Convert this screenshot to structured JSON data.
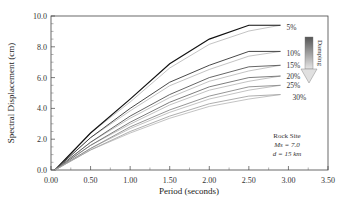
{
  "chart_data": {
    "type": "line",
    "title": "",
    "xlabel": "Period (seconds)",
    "ylabel": "Spectral Displacement (cm)",
    "xlim": [
      0.0,
      3.5
    ],
    "ylim": [
      0.0,
      10.0
    ],
    "xticks": [
      "0.00",
      "0.50",
      "1.00",
      "1.50",
      "2.00",
      "2.50",
      "3.00",
      "3.50"
    ],
    "yticks": [
      "0.0",
      "2.0",
      "4.0",
      "6.0",
      "8.0",
      "10.0"
    ],
    "grid": false,
    "x": [
      0.05,
      0.5,
      1.0,
      1.5,
      2.0,
      2.5,
      2.9
    ],
    "series": [
      {
        "name": "5%",
        "values": [
          0.0,
          2.4,
          4.6,
          6.9,
          8.5,
          9.4,
          9.4
        ],
        "color": "#111111"
      },
      {
        "name": "10%",
        "values": [
          0.0,
          2.1,
          4.0,
          5.7,
          6.8,
          7.7,
          7.7
        ],
        "color": "#333333"
      },
      {
        "name": "15%",
        "values": [
          0.0,
          1.8,
          3.5,
          4.9,
          6.0,
          6.7,
          6.8
        ],
        "color": "#555555"
      },
      {
        "name": "20%",
        "values": [
          0.0,
          1.6,
          3.1,
          4.4,
          5.4,
          6.0,
          6.1
        ],
        "color": "#6e6e6e"
      },
      {
        "name": "25%",
        "values": [
          0.0,
          1.4,
          2.8,
          3.9,
          4.8,
          5.4,
          5.5
        ],
        "color": "#8a8a8a"
      },
      {
        "name": "30%",
        "values": [
          0.0,
          1.3,
          2.5,
          3.5,
          4.3,
          4.8,
          4.9
        ],
        "color": "#a5a5a5"
      }
    ],
    "legend_position": "inline-right",
    "annotations": {
      "damping_arrow_label": "Damping",
      "site_note": [
        "Rock Site",
        "Ms = 7.0",
        "d = 15 km"
      ]
    }
  }
}
